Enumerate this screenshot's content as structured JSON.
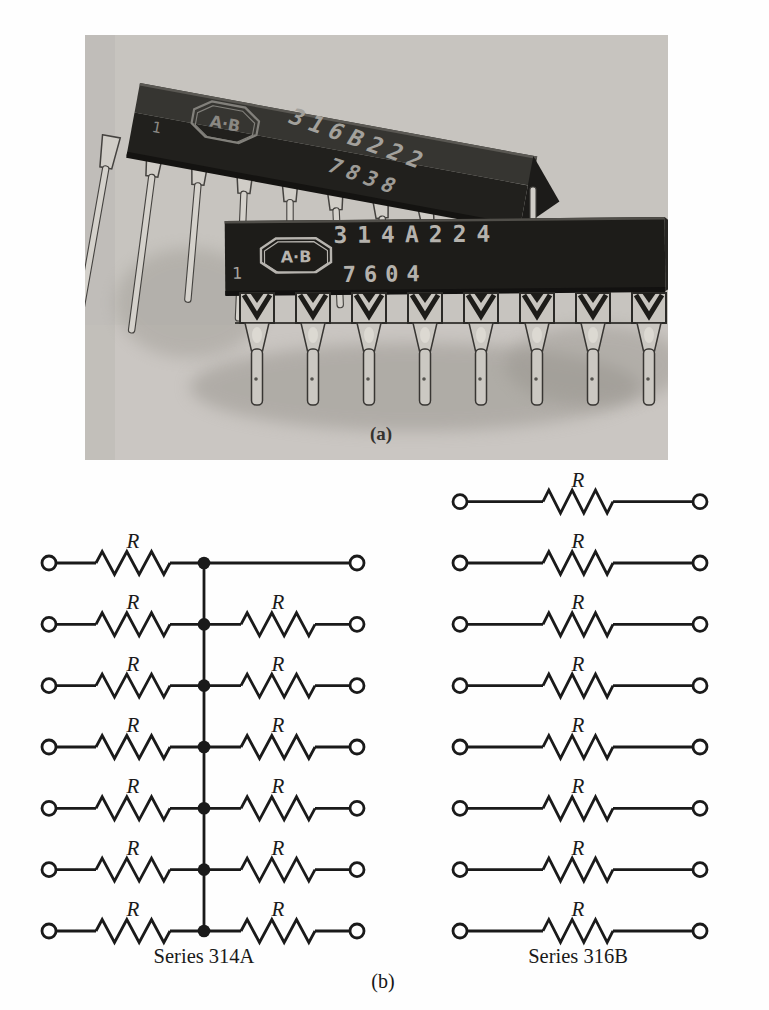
{
  "figure": {
    "panel_a": {
      "caption": "(a)",
      "background_color": "#c7c4bf",
      "chips": [
        {
          "id": "rear-chip",
          "logo": "A·B",
          "pin1_marker": "1",
          "part_number": "316B222",
          "date_code": "7838"
        },
        {
          "id": "front-chip",
          "logo": "A·B",
          "pin1_marker": "1",
          "part_number": "314A224",
          "date_code": "7604"
        }
      ]
    },
    "panel_b": {
      "caption": "(b)",
      "resistor_label": "R",
      "line_color": "#1a1a1a",
      "networks": [
        {
          "label": "Series 314A",
          "topology": "common-point",
          "row_count": 7,
          "rows": [
            {
              "left_resistor": true,
              "right_resistor": false
            },
            {
              "left_resistor": true,
              "right_resistor": true
            },
            {
              "left_resistor": true,
              "right_resistor": true
            },
            {
              "left_resistor": true,
              "right_resistor": true
            },
            {
              "left_resistor": true,
              "right_resistor": true
            },
            {
              "left_resistor": true,
              "right_resistor": true
            },
            {
              "left_resistor": true,
              "right_resistor": true
            }
          ]
        },
        {
          "label": "Series 316B",
          "topology": "isolated",
          "row_count": 8,
          "rows": [
            {
              "resistor": true
            },
            {
              "resistor": true
            },
            {
              "resistor": true
            },
            {
              "resistor": true
            },
            {
              "resistor": true
            },
            {
              "resistor": true
            },
            {
              "resistor": true
            },
            {
              "resistor": true
            }
          ]
        }
      ]
    }
  }
}
